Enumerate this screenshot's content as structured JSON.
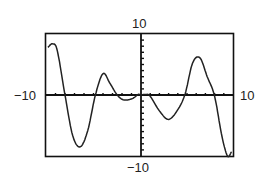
{
  "chart_data": {
    "type": "line",
    "title": "",
    "xlabel": "",
    "ylabel": "",
    "xlim": [
      -10,
      10
    ],
    "ylim": [
      -10,
      10
    ],
    "xscale_ticks": 1,
    "yscale_ticks": 1,
    "grid": false,
    "axis_labels": {
      "xmin": "-10",
      "xmax": "10",
      "ymin": "-10",
      "ymax": "10"
    },
    "series": [
      {
        "name": "f(x)",
        "x": [
          -9.8,
          -9.3,
          -8.8,
          -8.0,
          -7.2,
          -6.4,
          -5.6,
          -4.8,
          -4.0,
          -3.3,
          -2.6,
          -2.0,
          -1.4,
          -0.8,
          -0.3,
          0.0,
          0.5,
          1.0,
          2.0,
          3.0,
          4.0,
          4.8,
          5.6,
          6.4,
          7.2,
          8.0,
          8.8,
          9.4,
          9.8
        ],
        "y": [
          7.8,
          8.4,
          7.2,
          0.0,
          -6.6,
          -8.5,
          -5.8,
          0.0,
          3.5,
          2.0,
          0.2,
          -0.7,
          -0.8,
          -0.5,
          0.1,
          0.0,
          0.1,
          -0.2,
          -2.6,
          -4.0,
          -2.4,
          0.2,
          5.2,
          6.1,
          3.0,
          -0.2,
          -6.8,
          -10.0,
          -9.4
        ]
      }
    ]
  }
}
